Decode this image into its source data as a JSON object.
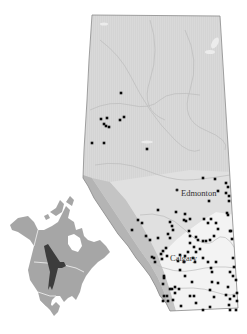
{
  "map": {
    "region": "Alberta",
    "colors": {
      "background": "#ffffff",
      "north_fill": "#d6d6d6",
      "rocky_mountains": "#b5b5b5",
      "foothills": "#c8c8c8",
      "central_parkland": "#e2e2e2",
      "southern_grassland": "#f2f2f2",
      "outline": "#8a8a8a",
      "rivers": "#bdbdbd",
      "dots": "#0a0a0a",
      "inset_land": "#a6a6a6",
      "inset_range": "#404040",
      "inset_borders": "#ffffff"
    },
    "cities": [
      {
        "name": "Edmonton",
        "x": 177,
        "y": 190,
        "label_x": 181,
        "label_y": 195
      },
      {
        "name": "Calgary",
        "x": 172,
        "y": 257,
        "label_x": 170,
        "label_y": 260
      }
    ]
  },
  "inset": {
    "region": "North America",
    "highlight": "species range (Great Plains / Prairies)"
  },
  "points": [
    [
      121,
      93
    ],
    [
      101,
      119
    ],
    [
      107,
      118
    ],
    [
      104,
      124
    ],
    [
      106,
      126
    ],
    [
      109,
      127
    ],
    [
      120,
      120
    ],
    [
      124,
      117
    ],
    [
      92,
      143
    ],
    [
      104,
      143
    ],
    [
      147,
      149
    ],
    [
      203,
      178
    ],
    [
      215,
      179
    ],
    [
      226,
      183
    ],
    [
      228,
      187
    ],
    [
      226,
      193
    ],
    [
      229,
      196
    ],
    [
      229,
      201
    ],
    [
      218,
      191
    ],
    [
      209,
      201
    ],
    [
      227,
      213
    ],
    [
      208,
      223
    ],
    [
      216,
      223
    ],
    [
      228,
      215
    ],
    [
      218,
      229
    ],
    [
      230,
      231
    ],
    [
      158,
      210
    ],
    [
      138,
      220
    ],
    [
      142,
      223
    ],
    [
      176,
      212
    ],
    [
      184,
      220
    ],
    [
      185,
      214
    ],
    [
      186,
      221
    ],
    [
      170,
      222
    ],
    [
      172,
      226
    ],
    [
      173,
      230
    ],
    [
      190,
      219
    ],
    [
      204,
      219
    ],
    [
      211,
      219
    ],
    [
      231,
      231
    ],
    [
      232,
      239
    ],
    [
      132,
      230
    ],
    [
      168,
      234
    ],
    [
      146,
      236
    ],
    [
      150,
      240
    ],
    [
      158,
      238
    ],
    [
      170,
      238
    ],
    [
      189,
      231
    ],
    [
      190,
      236
    ],
    [
      196,
      237
    ],
    [
      198,
      240
    ],
    [
      203,
      241
    ],
    [
      206,
      241
    ],
    [
      210,
      240
    ],
    [
      214,
      236
    ],
    [
      190,
      243
    ],
    [
      194,
      247
    ],
    [
      196,
      252
    ],
    [
      200,
      249
    ],
    [
      188,
      252
    ],
    [
      193,
      258
    ],
    [
      185,
      256
    ],
    [
      180,
      255
    ],
    [
      166,
      248
    ],
    [
      163,
      251
    ],
    [
      161,
      254
    ],
    [
      167,
      256
    ],
    [
      162,
      259
    ],
    [
      155,
      262
    ],
    [
      154,
      258
    ],
    [
      152,
      257
    ],
    [
      178,
      261
    ],
    [
      184,
      262
    ],
    [
      195,
      262
    ],
    [
      203,
      258
    ],
    [
      216,
      262
    ],
    [
      208,
      262
    ],
    [
      211,
      268
    ],
    [
      212,
      272
    ],
    [
      233,
      258
    ],
    [
      234,
      267
    ],
    [
      230,
      272
    ],
    [
      233,
      276
    ],
    [
      236,
      280
    ],
    [
      180,
      270
    ],
    [
      185,
      276
    ],
    [
      164,
      276
    ],
    [
      163,
      284
    ],
    [
      164,
      278
    ],
    [
      192,
      282
    ],
    [
      170,
      289
    ],
    [
      172,
      289
    ],
    [
      175,
      287
    ],
    [
      179,
      289
    ],
    [
      212,
      282
    ],
    [
      218,
      283
    ],
    [
      228,
      287
    ],
    [
      237,
      293
    ],
    [
      164,
      296
    ],
    [
      167,
      296
    ],
    [
      175,
      293
    ],
    [
      181,
      306
    ],
    [
      190,
      296
    ],
    [
      194,
      296
    ],
    [
      196,
      303
    ],
    [
      203,
      310
    ],
    [
      210,
      307
    ],
    [
      214,
      297
    ],
    [
      226,
      295
    ],
    [
      230,
      299
    ],
    [
      229,
      305
    ],
    [
      234,
      296
    ],
    [
      237,
      301
    ],
    [
      210,
      290
    ],
    [
      230,
      310
    ],
    [
      236,
      310
    ],
    [
      168,
      301
    ],
    [
      173,
      300
    ],
    [
      163,
      301
    ]
  ]
}
